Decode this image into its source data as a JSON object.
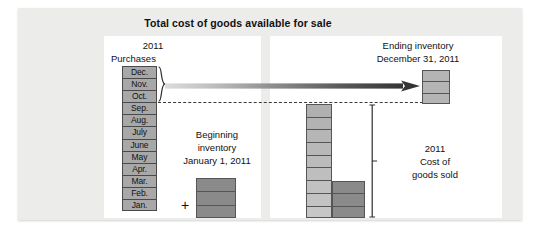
{
  "figure": {
    "title": "Total cost of goods available for sale",
    "type": "accounting-flow-diagram"
  },
  "purchases": {
    "year": "2011",
    "label": "Purchases",
    "months": [
      "Dec.",
      "Nov.",
      "Oct.",
      "Sep.",
      "Aug.",
      "July",
      "June",
      "May",
      "Apr.",
      "Mar.",
      "Feb.",
      "Jan."
    ],
    "braced_months": [
      "Dec.",
      "Nov.",
      "Oct."
    ]
  },
  "beginning_inventory": {
    "line1": "Beginning",
    "line2": "inventory",
    "line3": "January 1, 2011",
    "operator": "+",
    "segments": 3
  },
  "ending_inventory": {
    "line1": "Ending inventory",
    "line2": "December 31, 2011",
    "segments": 3
  },
  "cost_of_goods_sold": {
    "line1": "2011",
    "line2": "Cost of",
    "line3": "goods sold",
    "light_segments": 9,
    "dark_segments": 3
  },
  "colors": {
    "month_cell": "#a8a8a8",
    "segment_light": "#b4b4b4",
    "segment_lighter": "#c3c3c3",
    "segment_dark": "#8a8a8a",
    "outline": "#4a4a4a",
    "panel_background": "#ffffff",
    "figure_background": "#ececeb",
    "arrow_start": "#d6d6d6",
    "arrow_end": "#3d3d3d"
  },
  "icons": {
    "flow_arrow": "right-arrow-icon",
    "brace": "curly-brace-icon",
    "bracket": "square-bracket-icon",
    "dashed_rule": "dashed-divider-icon",
    "plus": "plus-icon"
  }
}
